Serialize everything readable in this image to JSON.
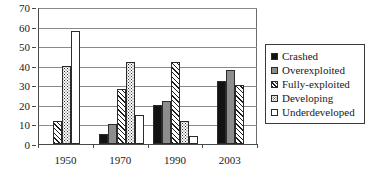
{
  "chart_data": {
    "type": "bar",
    "title": "",
    "subtitle": "",
    "xlabel": "",
    "ylabel": "",
    "categories": [
      "1950",
      "1970",
      "1990",
      "2003"
    ],
    "series": [
      {
        "name": "Crashed",
        "values": [
          0,
          5,
          20,
          32
        ],
        "fill": "solid-black",
        "color": "#121212"
      },
      {
        "name": "Overexploited",
        "values": [
          0,
          10,
          22,
          38
        ],
        "fill": "solid-gray",
        "color": "#8d8d8d"
      },
      {
        "name": "Fully-exploited",
        "values": [
          12,
          28,
          42,
          30
        ],
        "fill": "diagonal-hatch",
        "color": "#1d1d1d"
      },
      {
        "name": "Developing",
        "values": [
          40,
          42,
          12,
          0
        ],
        "fill": "dotted",
        "color": "#2a2a2a"
      },
      {
        "name": "Underdeveloped",
        "values": [
          58,
          15,
          4,
          0
        ],
        "fill": "empty-white",
        "color": "#ffffff"
      }
    ],
    "ylim": [
      0,
      70
    ],
    "yticks": [
      0,
      10,
      20,
      30,
      40,
      50,
      60,
      70
    ],
    "ytick_labels": [
      "0",
      "10",
      "20",
      "30",
      "40",
      "50",
      "60",
      "70"
    ],
    "grid": true,
    "grid_axis": "y",
    "legend_position": "right",
    "legend_border": true,
    "axis_color": "#4a4a4a",
    "grid_color": "#8a8a8a"
  }
}
